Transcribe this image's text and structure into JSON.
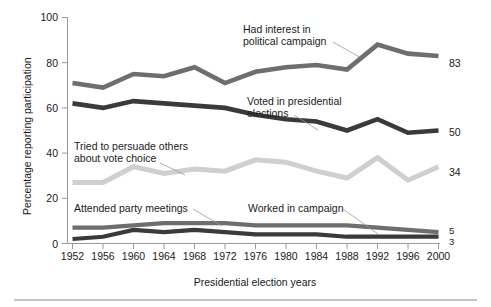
{
  "chart_data": {
    "type": "line",
    "title": "",
    "xlabel": "Presidential election years",
    "ylabel": "Percentage reporting participation",
    "categories": [
      1952,
      1956,
      1960,
      1964,
      1968,
      1972,
      1976,
      1980,
      1984,
      1988,
      1992,
      1996,
      2000
    ],
    "tick_labels_x": [
      "1952",
      "1956",
      "1960",
      "1964",
      "1968",
      "1972",
      "1976",
      "1980",
      "1984",
      "1988",
      "1992",
      "1996",
      "2000"
    ],
    "tick_labels_y": [
      "0",
      "20",
      "40",
      "60",
      "80",
      "100"
    ],
    "ylim": [
      0,
      100
    ],
    "yticks": [
      0,
      20,
      40,
      60,
      80,
      100
    ],
    "grid": false,
    "legend": "inline-annotations",
    "series": [
      {
        "name": "Had interest in political campaign",
        "color": "#6e6e6e",
        "end_value_label": "83",
        "values": [
          71,
          69,
          75,
          74,
          78,
          71,
          76,
          78,
          79,
          77,
          88,
          84,
          83
        ]
      },
      {
        "name": "Voted in presidential elections",
        "color": "#3a3a3a",
        "end_value_label": "50",
        "values": [
          62,
          60,
          63,
          62,
          61,
          60,
          57,
          55,
          54,
          50,
          55,
          49,
          50
        ]
      },
      {
        "name": "Tried to persuade others about vote choice",
        "color": "#cfcfcf",
        "end_value_label": "34",
        "values": [
          27,
          27,
          34,
          31,
          33,
          32,
          37,
          36,
          32,
          29,
          38,
          28,
          34
        ]
      },
      {
        "name": "Attended party meetings",
        "color": "#6e6e6e",
        "end_value_label": "5",
        "values": [
          7,
          7,
          8,
          9,
          9,
          9,
          8,
          8,
          8,
          8,
          7,
          6,
          5
        ]
      },
      {
        "name": "Worked in campaign",
        "color": "#3a3a3a",
        "end_value_label": "3",
        "values": [
          2,
          3,
          6,
          5,
          6,
          5,
          4,
          4,
          4,
          3,
          3,
          3,
          3
        ]
      }
    ],
    "annotations": [
      {
        "name": "had-interest",
        "lines": [
          "Had interest in",
          "political campaign"
        ]
      },
      {
        "name": "voted",
        "lines": [
          "Voted in presidential",
          "elections"
        ]
      },
      {
        "name": "persuade",
        "lines": [
          "Tried to persuade others",
          "about vote choice"
        ]
      },
      {
        "name": "attended",
        "lines": [
          "Attended party meetings"
        ]
      },
      {
        "name": "worked",
        "lines": [
          "Worked in campaign"
        ]
      }
    ]
  }
}
